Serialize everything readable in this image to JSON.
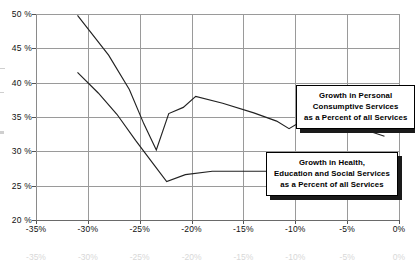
{
  "chart_data": {
    "type": "line",
    "title": "",
    "xlabel": "",
    "ylabel": "",
    "xlim": [
      -35,
      0
    ],
    "ylim": [
      20,
      50
    ],
    "grid": true,
    "legend_position": "inline-callouts",
    "x_ticks": [
      "-35%",
      "-30%",
      "-25%",
      "-20%",
      "-15%",
      "-10%",
      "-5%",
      "0%"
    ],
    "x_tick_values": [
      -35,
      -30,
      -25,
      -20,
      -15,
      -10,
      -5,
      0
    ],
    "y_ticks": [
      "20 %",
      "25 %",
      "30 %",
      "35 %",
      "40 %",
      "45 %",
      "50 %"
    ],
    "y_tick_values": [
      20,
      25,
      30,
      35,
      40,
      45,
      50
    ],
    "series": [
      {
        "name": "Growth in Personal Consumptive Services as a Percent of all Services",
        "x": [
          -31.0,
          -28.0,
          -26.0,
          -24.6,
          -23.4,
          -22.2,
          -20.8,
          -19.6,
          -17.0,
          -14.0,
          -11.8,
          -10.6,
          -9.6,
          -8.6,
          -7.0,
          -5.0,
          -3.0,
          -1.4
        ],
        "values": [
          49.8,
          44.0,
          39.0,
          34.0,
          30.2,
          35.5,
          36.4,
          38.0,
          37.0,
          35.6,
          34.4,
          33.3,
          34.2,
          34.6,
          34.4,
          33.8,
          33.0,
          32.2
        ]
      },
      {
        "name": "Growth in Health, Education and Social Services as a Percent of all Services",
        "x": [
          -31.0,
          -29.0,
          -27.2,
          -25.4,
          -23.6,
          -22.4,
          -20.6,
          -18.0,
          -14.0,
          -11.0,
          -9.0,
          -7.0,
          -5.0,
          -3.0,
          -1.2
        ],
        "values": [
          41.5,
          38.5,
          35.4,
          31.6,
          28.0,
          25.6,
          26.6,
          27.1,
          27.1,
          27.1,
          27.1,
          26.4,
          25.3,
          24.1,
          23.1
        ]
      }
    ],
    "callouts": [
      {
        "id": "callout-personal-consumptive",
        "lines": [
          "Growth in Personal",
          "Consumptive Services",
          "as a Percent of all Services"
        ]
      },
      {
        "id": "callout-health-education-social",
        "lines": [
          "Growth in Health,",
          "Education and Social Services",
          "as a Percent of all Services"
        ]
      }
    ],
    "colors": {
      "line": "#222222",
      "grid": "#9a9a9a",
      "axis": "#6a6a6a",
      "box_shadow": "#1a1a1a"
    }
  }
}
